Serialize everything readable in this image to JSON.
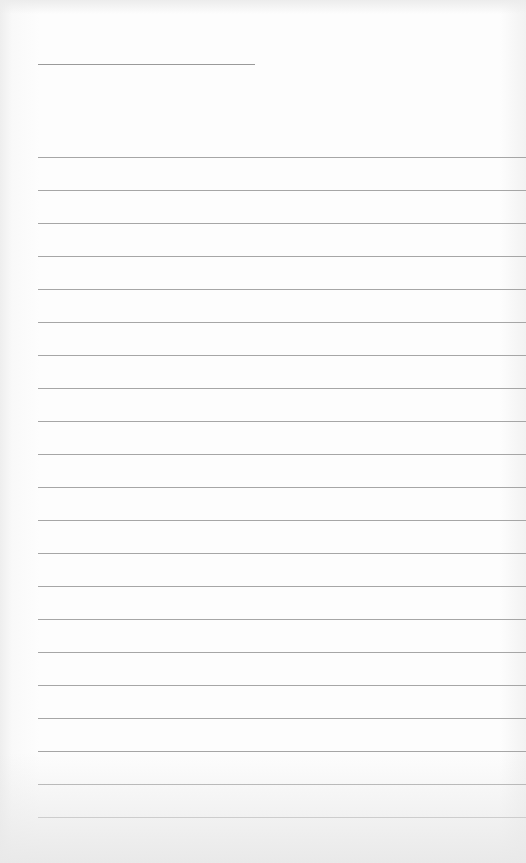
{
  "page": {
    "type": "lined-paper",
    "background_color": "#fafafa",
    "line_color": "#a6a6a6",
    "title_line": {
      "x": 38,
      "y": 64,
      "width": 217
    },
    "rules": {
      "count": 21,
      "start_y": 157,
      "spacing": 33,
      "x": 38,
      "width": 488
    }
  }
}
